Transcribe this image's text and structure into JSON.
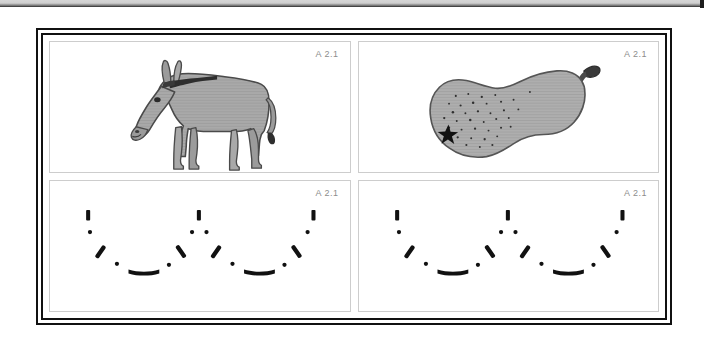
{
  "page": {
    "background_color": "#ffffff",
    "frame_border_color": "#111111",
    "panel_border_color": "#cdcdcd",
    "label_color": "#8d8d8d",
    "figure_fill_color": "#a9a9a9",
    "figure_outline_color": "#4a4a4a",
    "stroke_color": "#111111"
  },
  "panels": [
    {
      "id": "panel-donkey",
      "label": "A 2.1",
      "content_name": "donkey-illustration",
      "position": "top-left"
    },
    {
      "id": "panel-pear",
      "label": "A 2.1",
      "content_name": "pear-illustration",
      "position": "top-right"
    },
    {
      "id": "panel-curve-left",
      "label": "A 2.1",
      "content_name": "dashed-double-curve",
      "position": "bottom-left"
    },
    {
      "id": "panel-curve-right",
      "label": "A 2.1",
      "content_name": "dashed-double-curve",
      "position": "bottom-right"
    }
  ]
}
